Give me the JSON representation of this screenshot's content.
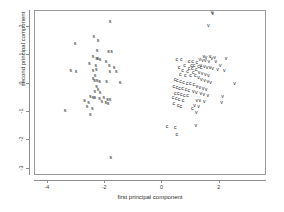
{
  "chart_data": {
    "type": "scatter",
    "title": "",
    "subtitle": "",
    "xlabel": "first principal component",
    "ylabel": "second principal component",
    "xlim": [
      -4.45,
      3.65
    ],
    "ylim": [
      -3.25,
      2.55
    ],
    "xticks": [
      -4,
      -2,
      0,
      2
    ],
    "xticklabels": [
      "-4",
      "-2",
      "0",
      "2"
    ],
    "yticks": [
      2,
      1,
      0,
      -1,
      -2,
      -3
    ],
    "yticklabels": [
      "2",
      "1",
      "0",
      "-1",
      "-2",
      "-3"
    ],
    "grid": false,
    "legend": "none",
    "marker_style": "text-glyph",
    "point_color": "#1a1a1a",
    "frame_color": "#9a9a9a",
    "axis_color": "#8e8e8e",
    "groups": [
      {
        "name": "s",
        "label": "s",
        "count": 50
      },
      {
        "name": "c",
        "label": "c",
        "count": 50
      },
      {
        "name": "v",
        "label": "v",
        "count": 50
      }
    ],
    "series": [
      {
        "name": "s",
        "label": "s",
        "points": [
          [
            -1.83,
            2.18
          ],
          [
            -2.4,
            1.63
          ],
          [
            -2.25,
            1.48
          ],
          [
            -3.05,
            1.4
          ],
          [
            -2.28,
            1.13
          ],
          [
            -1.88,
            1.12
          ],
          [
            -1.78,
            1.12
          ],
          [
            -2.42,
            0.92
          ],
          [
            -2.3,
            0.88
          ],
          [
            -2.26,
            0.86
          ],
          [
            -2.18,
            0.83
          ],
          [
            -1.97,
            0.77
          ],
          [
            -2.55,
            0.7
          ],
          [
            -2.33,
            0.62
          ],
          [
            -1.86,
            0.6
          ],
          [
            -1.69,
            0.55
          ],
          [
            -3.2,
            0.44
          ],
          [
            -3.02,
            0.42
          ],
          [
            -2.42,
            0.45
          ],
          [
            -2.31,
            0.46
          ],
          [
            -1.84,
            0.42
          ],
          [
            -1.61,
            0.4
          ],
          [
            -2.35,
            0.26
          ],
          [
            -2.42,
            0.17
          ],
          [
            -2.37,
            0.1
          ],
          [
            -2.28,
            0.08
          ],
          [
            -2.2,
            0.05
          ],
          [
            -1.95,
            0.04
          ],
          [
            -1.48,
            0.01
          ],
          [
            -2.3,
            -0.12
          ],
          [
            -2.25,
            -0.21
          ],
          [
            -2.36,
            -0.3
          ],
          [
            -2.18,
            -0.33
          ],
          [
            -2.52,
            -0.48
          ],
          [
            -2.42,
            -0.5
          ],
          [
            -2.36,
            -0.52
          ],
          [
            -2.2,
            -0.54
          ],
          [
            -2.05,
            -0.51
          ],
          [
            -1.92,
            -0.58
          ],
          [
            -1.83,
            -0.59
          ],
          [
            -2.72,
            -0.6
          ],
          [
            -2.58,
            -0.67
          ],
          [
            -2.12,
            -0.65
          ],
          [
            -1.98,
            -0.7
          ],
          [
            -1.9,
            -0.73
          ],
          [
            -2.63,
            -0.82
          ],
          [
            -2.45,
            -0.89
          ],
          [
            -3.4,
            -0.95
          ],
          [
            -2.52,
            -1.1
          ],
          [
            -1.8,
            -2.62
          ]
        ]
      },
      {
        "name": "c",
        "label": "c",
        "points": [
          [
            0.5,
            0.84
          ],
          [
            0.66,
            0.82
          ],
          [
            0.93,
            0.76
          ],
          [
            1.05,
            0.74
          ],
          [
            1.2,
            0.72
          ],
          [
            0.77,
            0.63
          ],
          [
            1.02,
            0.62
          ],
          [
            1.1,
            0.6
          ],
          [
            1.26,
            0.58
          ],
          [
            1.35,
            0.56
          ],
          [
            0.58,
            0.54
          ],
          [
            0.93,
            0.52
          ],
          [
            1.04,
            0.5
          ],
          [
            1.17,
            0.48
          ],
          [
            0.7,
            0.43
          ],
          [
            0.88,
            0.4
          ],
          [
            1.08,
            0.38
          ],
          [
            0.62,
            0.3
          ],
          [
            0.8,
            0.28
          ],
          [
            0.98,
            0.27
          ],
          [
            1.15,
            0.25
          ],
          [
            0.44,
            0.12
          ],
          [
            0.52,
            0.08
          ],
          [
            0.63,
            0.05
          ],
          [
            0.74,
            0.03
          ],
          [
            0.86,
            0.0
          ],
          [
            0.97,
            -0.03
          ],
          [
            1.09,
            -0.06
          ],
          [
            0.4,
            -0.12
          ],
          [
            0.5,
            -0.15
          ],
          [
            0.6,
            -0.18
          ],
          [
            0.7,
            -0.2
          ],
          [
            0.82,
            -0.23
          ],
          [
            0.92,
            -0.25
          ],
          [
            0.45,
            -0.35
          ],
          [
            0.55,
            -0.38
          ],
          [
            0.66,
            -0.4
          ],
          [
            0.76,
            -0.43
          ],
          [
            0.88,
            -0.45
          ],
          [
            0.37,
            -0.52
          ],
          [
            0.48,
            -0.56
          ],
          [
            0.58,
            -0.58
          ],
          [
            0.72,
            -0.6
          ],
          [
            0.4,
            -0.72
          ],
          [
            0.55,
            -0.78
          ],
          [
            0.64,
            -0.82
          ],
          [
            1.04,
            -0.88
          ],
          [
            0.16,
            -1.52
          ],
          [
            0.45,
            -1.58
          ],
          [
            0.5,
            -1.8
          ]
        ]
      },
      {
        "name": "v",
        "label": "v",
        "points": [
          [
            1.73,
            2.48
          ],
          [
            1.76,
            2.46
          ],
          [
            1.6,
            2.02
          ],
          [
            1.44,
            0.92
          ],
          [
            1.52,
            0.9
          ],
          [
            1.66,
            0.94
          ],
          [
            1.72,
            0.88
          ],
          [
            1.82,
            0.9
          ],
          [
            2.22,
            0.86
          ],
          [
            1.3,
            0.82
          ],
          [
            1.4,
            0.8
          ],
          [
            1.5,
            0.78
          ],
          [
            1.62,
            0.76
          ],
          [
            1.86,
            0.74
          ],
          [
            2.02,
            0.62
          ],
          [
            1.34,
            0.6
          ],
          [
            1.46,
            0.58
          ],
          [
            1.56,
            0.55
          ],
          [
            1.66,
            0.53
          ],
          [
            1.75,
            0.5
          ],
          [
            1.92,
            0.48
          ],
          [
            2.16,
            0.44
          ],
          [
            1.28,
            0.36
          ],
          [
            1.38,
            0.33
          ],
          [
            1.5,
            0.3
          ],
          [
            1.6,
            0.26
          ],
          [
            1.26,
            0.18
          ],
          [
            1.36,
            0.14
          ],
          [
            1.47,
            0.1
          ],
          [
            1.58,
            0.06
          ],
          [
            1.68,
            0.02
          ],
          [
            2.52,
            0.0
          ],
          [
            1.2,
            -0.12
          ],
          [
            1.3,
            -0.16
          ],
          [
            1.42,
            -0.2
          ],
          [
            1.52,
            -0.24
          ],
          [
            1.08,
            -0.3
          ],
          [
            1.18,
            -0.34
          ],
          [
            1.34,
            -0.37
          ],
          [
            1.44,
            -0.4
          ],
          [
            1.58,
            -0.44
          ],
          [
            2.1,
            -0.48
          ],
          [
            1.2,
            -0.6
          ],
          [
            1.3,
            -0.63
          ],
          [
            1.46,
            -0.66
          ],
          [
            1.12,
            -0.8
          ],
          [
            1.26,
            -0.83
          ],
          [
            2.06,
            -0.7
          ],
          [
            1.18,
            -1.02
          ],
          [
            1.16,
            -1.48
          ]
        ]
      }
    ]
  }
}
